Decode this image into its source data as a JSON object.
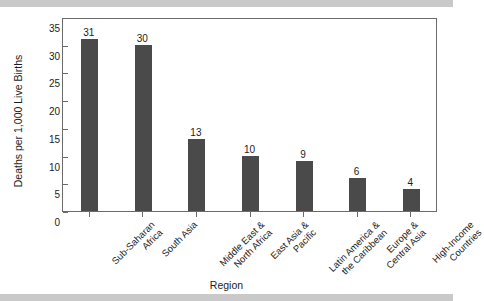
{
  "chart_data": {
    "type": "bar",
    "title": "",
    "xlabel": "Region",
    "ylabel": "Deaths per 1,000 Live Births",
    "categories": [
      "Sub-Saharan Africa",
      "South Asia",
      "Middle East & North Africa",
      "East Asia & Pacific",
      "Latin America & the Caribbean",
      "Europe & Central Asia",
      "High-Income Countries"
    ],
    "category_lines": [
      [
        "Sub-Saharan",
        "Africa"
      ],
      [
        "South Asia"
      ],
      [
        "Middle East &",
        "North Africa"
      ],
      [
        "East Asia &",
        "Pacific"
      ],
      [
        "Latin America &",
        "the Caribbean"
      ],
      [
        "Europe &",
        "Central Asia"
      ],
      [
        "High-Income",
        "Countries"
      ]
    ],
    "values": [
      31,
      30,
      13,
      10,
      9,
      6,
      4
    ],
    "value_labels": [
      "31",
      "30",
      "13",
      "10",
      "9",
      "6",
      "4"
    ],
    "ylim": [
      0,
      35
    ],
    "ytick_labels": [
      "0",
      "5",
      "10",
      "15",
      "20",
      "25",
      "30",
      "35"
    ],
    "ytick_values": [
      0,
      5,
      10,
      15,
      20,
      25,
      30,
      35
    ],
    "grid": false,
    "legend": false,
    "bar_color": "#4a4a4a",
    "axis_color": "#6b6b6b",
    "text_color": "#1c1c1c",
    "background_color": "#ffffff",
    "band_color": "#c9c9c9"
  }
}
